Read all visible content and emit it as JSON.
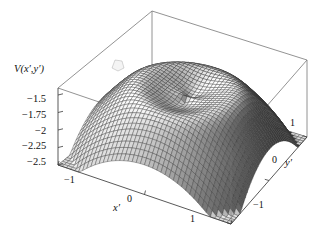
{
  "chart_data": {
    "type": "surface",
    "title": "",
    "zlabel": "V(x',y')",
    "xlabel": "x'",
    "ylabel": "y'",
    "x": [
      -1.0,
      1.0
    ],
    "y": [
      -1.0,
      1.0
    ],
    "xticks": [
      "-1",
      "0",
      "1"
    ],
    "xtick_values": [
      -1,
      0,
      1
    ],
    "yticks": [
      "-1",
      "0",
      "1"
    ],
    "ytick_values": [
      -1,
      0,
      1
    ],
    "zticks": [
      "-1.5",
      "-1.75",
      "-2",
      "-2.25",
      "-2.5"
    ],
    "ztick_values": [
      -1.5,
      -1.75,
      -2.0,
      -2.25,
      -2.5
    ],
    "zlim": [
      -2.5,
      -1.4
    ],
    "grid": true,
    "mesh": true,
    "legend": null,
    "surface_model": {
      "kind": "radial-dome-with-central-dip",
      "peak_ring_z": -1.45,
      "center_dip_z": -1.72,
      "corner_z": -2.5,
      "dip_radius": 0.42,
      "ring_radius": 0.62
    },
    "highlight_patch": {
      "x": 118,
      "y": 65,
      "note": "small light mesh artifact on near-left flank"
    }
  },
  "ticks": {
    "z": [
      {
        "label": "-1.5",
        "x": 27,
        "y": 94
      },
      {
        "label": "-1.75",
        "x": 22,
        "y": 110
      },
      {
        "label": "-2",
        "x": 35,
        "y": 126
      },
      {
        "label": "-2.25",
        "x": 22,
        "y": 141
      },
      {
        "label": "-2.5",
        "x": 27,
        "y": 157
      }
    ],
    "x": [
      {
        "label": "-1",
        "x": 64,
        "y": 175
      },
      {
        "label": "0",
        "x": 127,
        "y": 194
      },
      {
        "label": "1",
        "x": 190,
        "y": 214
      }
    ],
    "y": [
      {
        "label": "1",
        "x": 290,
        "y": 118
      },
      {
        "label": "0",
        "x": 272,
        "y": 155
      },
      {
        "label": "-1",
        "x": 253,
        "y": 200
      }
    ]
  },
  "axis_labels": {
    "z": {
      "base": "V",
      "arg_open": "(",
      "x": "x",
      "comma": ",",
      "y": "y",
      "arg_close": ")",
      "px": 14,
      "py": 64
    },
    "x": {
      "base": "x",
      "px": 113,
      "py": 203
    },
    "y": {
      "base": "y",
      "px": 285,
      "py": 158
    }
  },
  "style": {
    "background": "#ffffff",
    "line": "#3b3b3b",
    "box": "#777777",
    "mesh_light": "#f2f2f2",
    "mesh_dark": "#2a2a2a",
    "text": "#111111"
  }
}
